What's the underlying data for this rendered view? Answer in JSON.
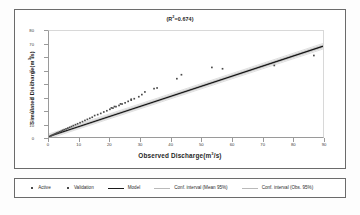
{
  "chart_data": {
    "type": "scatter",
    "title_prefix": "(R",
    "title_sup": "2",
    "title_suffix": "=0.674)",
    "xlabel": "Observed Discharge(m³/s)",
    "xlabel_prefix": "Observed  Discharge(m",
    "xlabel_sup": "3",
    "xlabel_suffix": "/s)",
    "ylabel": "Simulated Discharge(m³/s)",
    "ylabel_prefix": "Simulated Discharge(m",
    "ylabel_sup": "3",
    "ylabel_suffix": "/s)",
    "xlim": [
      0,
      90
    ],
    "ylim": [
      0,
      80
    ],
    "xticks": [
      0,
      10,
      20,
      30,
      40,
      50,
      60,
      70,
      80,
      90
    ],
    "yticks": [
      0,
      10,
      20,
      30,
      40,
      50,
      60,
      70,
      80
    ],
    "grid": false,
    "legend_position": "below-plot",
    "r_squared": 0.674,
    "series": [
      {
        "name": "Active",
        "marker": "small-square",
        "color": "#4a4a4a",
        "points": [
          [
            0.6,
            0.9
          ],
          [
            1.0,
            1.3
          ],
          [
            1.4,
            1.7
          ],
          [
            1.8,
            2.2
          ],
          [
            2.2,
            2.6
          ],
          [
            2.6,
            3.0
          ],
          [
            3.0,
            3.4
          ],
          [
            3.5,
            3.9
          ],
          [
            4.0,
            4.4
          ],
          [
            4.5,
            5.0
          ],
          [
            5.0,
            5.5
          ],
          [
            5.6,
            6.1
          ],
          [
            6.2,
            6.7
          ],
          [
            6.8,
            7.3
          ],
          [
            7.4,
            7.9
          ],
          [
            8.0,
            8.6
          ],
          [
            8.7,
            9.3
          ],
          [
            9.4,
            10.0
          ],
          [
            10.2,
            10.8
          ],
          [
            11.0,
            11.6
          ],
          [
            11.8,
            12.5
          ],
          [
            12.6,
            13.3
          ],
          [
            13.4,
            14.1
          ],
          [
            14.2,
            14.9
          ],
          [
            15.0,
            16.2
          ],
          [
            16.0,
            16.9
          ],
          [
            17.0,
            17.8
          ],
          [
            18.0,
            18.9
          ],
          [
            19.0,
            19.8
          ],
          [
            20.0,
            20.9
          ],
          [
            21.0,
            21.8
          ],
          [
            22.0,
            22.9
          ],
          [
            23.0,
            23.8
          ],
          [
            24.0,
            24.9
          ],
          [
            25.0,
            25.8
          ],
          [
            26.0,
            26.9
          ],
          [
            27.0,
            27.8
          ],
          [
            28.0,
            28.9
          ],
          [
            29.5,
            30.4
          ]
        ]
      },
      {
        "name": "Validation",
        "marker": "small-square",
        "color": "#4a4a4a",
        "points": [
          [
            20.5,
            22.0
          ],
          [
            21.5,
            23.0
          ],
          [
            23.5,
            25.0
          ],
          [
            27.0,
            28.5
          ],
          [
            30.5,
            32.0
          ],
          [
            31.5,
            34.0
          ],
          [
            34.5,
            36.5
          ],
          [
            35.5,
            37.0
          ],
          [
            42.0,
            44.0
          ],
          [
            43.5,
            47.0
          ],
          [
            53.5,
            52.5
          ],
          [
            57.0,
            51.5
          ],
          [
            74.0,
            54.0
          ],
          [
            87.0,
            61.5
          ]
        ]
      }
    ],
    "lines": [
      {
        "name": "Model",
        "style": "solid-thick",
        "color": "#1a1a1a",
        "points": [
          [
            0,
            0.5
          ],
          [
            90,
            68.5
          ]
        ]
      },
      {
        "name": "Conf. interval (Mean 95%)",
        "style": "solid-thin",
        "color": "#b9b9b9",
        "points_upper": [
          [
            0,
            1.4
          ],
          [
            90,
            69.6
          ]
        ],
        "points_lower": [
          [
            0,
            -0.3
          ],
          [
            90,
            67.4
          ]
        ]
      },
      {
        "name": "Conf. interval (Obs. 95%)",
        "style": "solid-thin",
        "color": "#cfcfcf",
        "points_upper": [
          [
            0,
            2.3
          ],
          [
            90,
            70.6
          ]
        ],
        "points_lower": [
          [
            0,
            -1.2
          ],
          [
            90,
            66.4
          ]
        ]
      }
    ]
  },
  "legend": {
    "items": [
      {
        "label": "Active",
        "type": "marker"
      },
      {
        "label": "Validation",
        "type": "marker"
      },
      {
        "label": "Model",
        "type": "line-thick"
      },
      {
        "label": "Conf. interval (Mean 95%)",
        "type": "line-thin"
      },
      {
        "label": "Conf. interval (Obs. 95%)",
        "type": "line-thin"
      }
    ]
  }
}
